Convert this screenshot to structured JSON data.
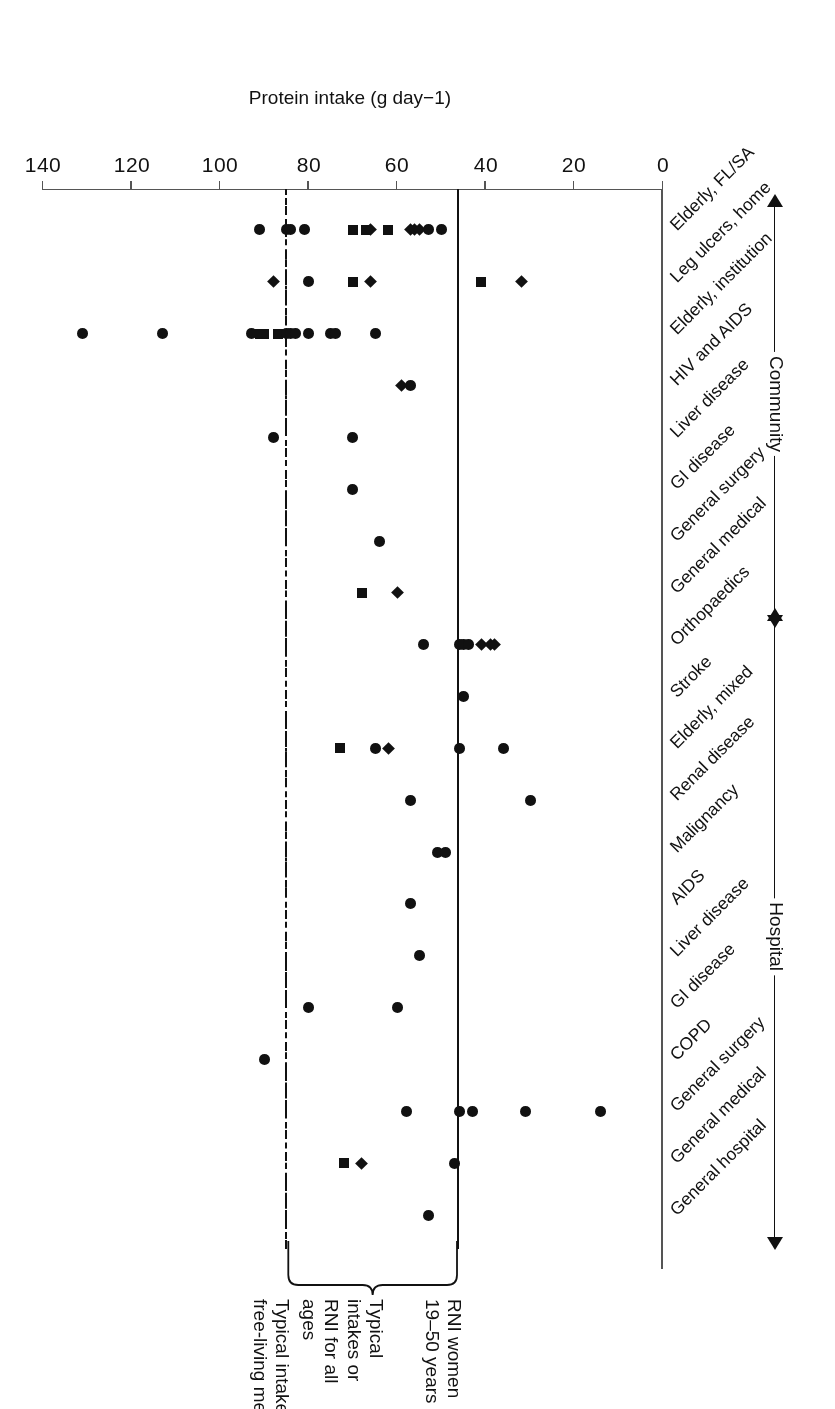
{
  "figure": {
    "orientation": "rotated-180",
    "axis_title": "Protein intake (g day−1)",
    "value_ticks": [
      0,
      20,
      40,
      60,
      80,
      100,
      120,
      140
    ],
    "group_labels": [
      "Hospital",
      "Community"
    ]
  },
  "annotations": [
    {
      "id": "typical-men",
      "text": "Typical intake\nfree-living men",
      "value": 85
    },
    {
      "id": "typical-all",
      "text": "Typical\nintakes or\nRNI for all\nages",
      "value": 65
    },
    {
      "id": "rni-women",
      "text": "RNI women\n19–50 years",
      "value": 46
    }
  ],
  "reference_lines": [
    {
      "id": "typical-intake-free-living-men",
      "value": 85,
      "style": "dash-dot"
    },
    {
      "id": "rni-women-19-50-years",
      "value": 46,
      "style": "solid"
    }
  ],
  "chart_data": {
    "type": "scatter",
    "title": "",
    "xlabel": "Protein intake (g day−1)",
    "ylabel": "",
    "xlim": [
      0,
      140
    ],
    "grid": false,
    "legend": "none",
    "marker_meaning": {
      "circle": "circle marker",
      "square": "square marker",
      "diamond": "diamond marker"
    },
    "groups": [
      {
        "name": "Hospital",
        "categories": [
          {
            "label": "General hospital",
            "points": [
              {
                "v": 53,
                "m": "circle"
              }
            ]
          },
          {
            "label": "General medical",
            "points": [
              {
                "v": 72,
                "m": "square"
              },
              {
                "v": 68,
                "m": "diamond"
              },
              {
                "v": 47,
                "m": "circle"
              }
            ]
          },
          {
            "label": "General surgery",
            "points": [
              {
                "v": 58,
                "m": "circle"
              },
              {
                "v": 46,
                "m": "circle"
              },
              {
                "v": 43,
                "m": "circle"
              },
              {
                "v": 31,
                "m": "circle"
              },
              {
                "v": 14,
                "m": "circle"
              }
            ]
          },
          {
            "label": "COPD",
            "points": [
              {
                "v": 90,
                "m": "circle"
              }
            ]
          },
          {
            "label": "GI disease",
            "points": [
              {
                "v": 80,
                "m": "circle"
              },
              {
                "v": 60,
                "m": "circle"
              }
            ]
          },
          {
            "label": "Liver disease",
            "points": [
              {
                "v": 55,
                "m": "circle"
              }
            ]
          },
          {
            "label": "AIDS",
            "points": [
              {
                "v": 57,
                "m": "circle"
              }
            ]
          },
          {
            "label": "Malignancy",
            "points": [
              {
                "v": 51,
                "m": "circle"
              },
              {
                "v": 49,
                "m": "circle"
              }
            ]
          },
          {
            "label": "Renal disease",
            "points": [
              {
                "v": 57,
                "m": "circle"
              },
              {
                "v": 30,
                "m": "circle"
              }
            ]
          },
          {
            "label": "Elderly, mixed",
            "points": [
              {
                "v": 73,
                "m": "square"
              },
              {
                "v": 65,
                "m": "circle"
              },
              {
                "v": 62,
                "m": "diamond"
              },
              {
                "v": 46,
                "m": "circle"
              },
              {
                "v": 36,
                "m": "circle"
              }
            ]
          },
          {
            "label": "Stroke",
            "points": [
              {
                "v": 45,
                "m": "circle"
              }
            ]
          },
          {
            "label": "Orthopaedics",
            "points": [
              {
                "v": 54,
                "m": "circle"
              },
              {
                "v": 46,
                "m": "circle"
              },
              {
                "v": 45,
                "m": "circle"
              },
              {
                "v": 44,
                "m": "circle"
              },
              {
                "v": 41,
                "m": "diamond"
              },
              {
                "v": 39,
                "m": "diamond"
              },
              {
                "v": 38,
                "m": "diamond"
              }
            ]
          }
        ]
      },
      {
        "name": "Community",
        "categories": [
          {
            "label": "General medical",
            "points": [
              {
                "v": 68,
                "m": "square"
              },
              {
                "v": 60,
                "m": "diamond"
              }
            ]
          },
          {
            "label": "General surgery",
            "points": [
              {
                "v": 64,
                "m": "circle"
              }
            ]
          },
          {
            "label": "GI disease",
            "points": [
              {
                "v": 70,
                "m": "circle"
              }
            ]
          },
          {
            "label": "Liver disease",
            "points": [
              {
                "v": 88,
                "m": "circle"
              },
              {
                "v": 70,
                "m": "circle"
              }
            ]
          },
          {
            "label": "HIV and AIDS",
            "points": [
              {
                "v": 59,
                "m": "diamond"
              },
              {
                "v": 57,
                "m": "circle"
              }
            ]
          },
          {
            "label": "Elderly, institution",
            "points": [
              {
                "v": 131,
                "m": "circle"
              },
              {
                "v": 113,
                "m": "circle"
              },
              {
                "v": 93,
                "m": "circle"
              },
              {
                "v": 91,
                "m": "square"
              },
              {
                "v": 90,
                "m": "square"
              },
              {
                "v": 87,
                "m": "square"
              },
              {
                "v": 85,
                "m": "circle"
              },
              {
                "v": 84,
                "m": "circle"
              },
              {
                "v": 83,
                "m": "circle"
              },
              {
                "v": 80,
                "m": "circle"
              },
              {
                "v": 75,
                "m": "circle"
              },
              {
                "v": 74,
                "m": "circle"
              },
              {
                "v": 65,
                "m": "circle"
              }
            ]
          },
          {
            "label": "Leg ulcers, home",
            "points": [
              {
                "v": 88,
                "m": "diamond"
              },
              {
                "v": 80,
                "m": "circle"
              },
              {
                "v": 70,
                "m": "square"
              },
              {
                "v": 66,
                "m": "diamond"
              },
              {
                "v": 41,
                "m": "square"
              },
              {
                "v": 32,
                "m": "diamond"
              }
            ]
          },
          {
            "label": "Elderly, FL/SA",
            "points": [
              {
                "v": 91,
                "m": "circle"
              },
              {
                "v": 85,
                "m": "circle"
              },
              {
                "v": 84,
                "m": "circle"
              },
              {
                "v": 81,
                "m": "circle"
              },
              {
                "v": 70,
                "m": "square"
              },
              {
                "v": 67,
                "m": "square"
              },
              {
                "v": 66,
                "m": "diamond"
              },
              {
                "v": 62,
                "m": "square"
              },
              {
                "v": 57,
                "m": "diamond"
              },
              {
                "v": 56,
                "m": "diamond"
              },
              {
                "v": 55,
                "m": "diamond"
              },
              {
                "v": 53,
                "m": "circle"
              },
              {
                "v": 50,
                "m": "circle"
              }
            ]
          }
        ]
      }
    ]
  }
}
